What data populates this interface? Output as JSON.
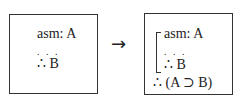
{
  "left_box": {
    "lines": [
      "asm: A",
      ". . .",
      "∴ B"
    ]
  },
  "arrow": "→",
  "right_box": {
    "subproof_lines": [
      "asm: A",
      ". . .",
      "∴ B"
    ],
    "conclusion": "∴ (A ⊃ B)"
  }
}
